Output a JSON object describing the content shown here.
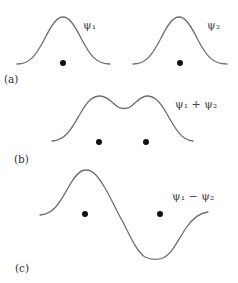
{
  "panels": [
    {
      "id": "a",
      "label": "(a)",
      "curves": [
        {
          "name": "psi1",
          "text": "ψ₁",
          "shape": "single-peak"
        },
        {
          "name": "psi2",
          "text": "ψ₂",
          "shape": "single-peak"
        }
      ],
      "nuclei_count": 2
    },
    {
      "id": "b",
      "label": "(b)",
      "curves": [
        {
          "name": "psi1-plus-psi2",
          "text": "ψ₁ + ψ₂",
          "shape": "double-peak"
        }
      ],
      "nuclei_count": 2
    },
    {
      "id": "c",
      "label": "(c)",
      "curves": [
        {
          "name": "psi1-minus-psi2",
          "text": "ψ₁ − ψ₂",
          "shape": "peak-then-trough"
        }
      ],
      "nuclei_count": 2
    }
  ],
  "colors": {
    "curve": "#6e6e6e",
    "nucleus": "#111111",
    "text": "#444444"
  }
}
